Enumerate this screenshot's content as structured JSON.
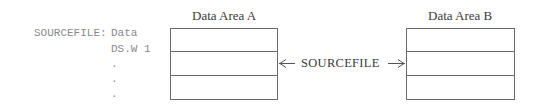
{
  "code": {
    "label": "SOURCEFILE:",
    "lines": [
      "Data",
      "DS.W 1",
      ".",
      ".",
      "."
    ]
  },
  "areas": [
    {
      "title": "Data Area A",
      "rows": 3
    },
    {
      "title": "Data Area B",
      "rows": 3
    }
  ],
  "pointer": {
    "label": "SOURCEFILE"
  }
}
